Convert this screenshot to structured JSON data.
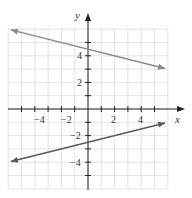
{
  "chart_data": {
    "type": "line",
    "title": "",
    "xlabel": "x",
    "ylabel": "y",
    "xlim": [
      -6,
      6
    ],
    "ylim": [
      -6,
      6
    ],
    "grid": true,
    "x_ticks": [
      -4,
      -2,
      2,
      4
    ],
    "y_ticks": [
      -4,
      -2,
      2,
      4
    ],
    "series": [
      {
        "name": "upper line",
        "color": "#8a8a8a",
        "equation": "y = -x/4 + 4.5",
        "x": [
          -5.8,
          5.8
        ],
        "y": [
          5.95,
          3.05
        ]
      },
      {
        "name": "lower line",
        "color": "#5a5a5a",
        "equation": "y = x/4 - 2.5",
        "x": [
          -5.8,
          5.8
        ],
        "y": [
          -3.95,
          -1.05
        ]
      }
    ]
  },
  "labels": {
    "x_axis": "x",
    "y_axis": "y",
    "x_tick_labels": [
      "−4",
      "−2",
      "2",
      "4"
    ],
    "y_tick_labels": [
      "4",
      "2",
      "−2",
      "−4"
    ]
  }
}
